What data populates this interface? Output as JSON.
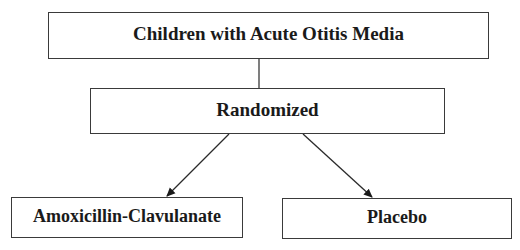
{
  "diagram": {
    "type": "flowchart",
    "nodes": {
      "root": {
        "label": "Children with Acute Otitis Media"
      },
      "randomized": {
        "label": "Randomized"
      },
      "arm_a": {
        "label": "Amoxicillin-Clavulanate"
      },
      "arm_b": {
        "label": "Placebo"
      }
    },
    "edges": [
      {
        "from": "root",
        "to": "randomized",
        "style": "line"
      },
      {
        "from": "randomized",
        "to": "arm_a",
        "style": "arrow"
      },
      {
        "from": "randomized",
        "to": "arm_b",
        "style": "arrow"
      }
    ],
    "colors": {
      "border": "#3a3a3a",
      "text": "#1a1a1a",
      "background": "#ffffff"
    }
  }
}
